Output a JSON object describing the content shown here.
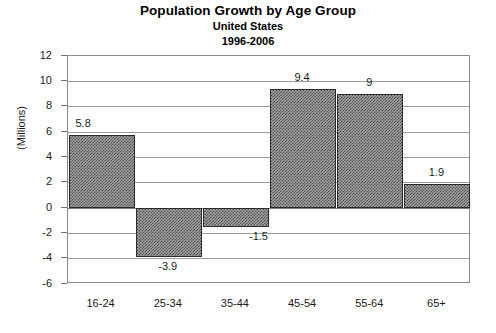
{
  "chart_data": {
    "type": "bar",
    "title": "Population Growth by Age Group",
    "subtitle": "United States",
    "subtitle2": "1996-2006",
    "xlabel": "",
    "ylabel": "(Millions)",
    "categories": [
      "16-24",
      "25-34",
      "35-44",
      "45-54",
      "55-64",
      "65+"
    ],
    "values": [
      5.8,
      -3.9,
      -1.5,
      9.4,
      9,
      1.9
    ],
    "value_labels": [
      "5.8",
      "-3.9",
      "-1.5",
      "9.4",
      "9",
      "1.9"
    ],
    "ylim": [
      -6,
      12
    ],
    "ytick_values": [
      12,
      10,
      8,
      6,
      4,
      2,
      0,
      -2,
      -4,
      -6
    ],
    "ytick_labels": [
      "12",
      "10",
      "8",
      "6",
      "4",
      "2",
      "0",
      "-2",
      "-4",
      "-6"
    ],
    "grid": true,
    "legend": false,
    "bar_fill": "#a6a6a6",
    "bar_pattern": "hatch-checker",
    "bar_border": "#2b2b2b",
    "gridline_color": "#9b9b9b",
    "frame_color": "#8a8a8a",
    "text_color": "#1a1a1a",
    "background": "#ffffff"
  }
}
